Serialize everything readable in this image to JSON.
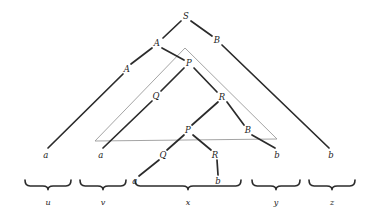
{
  "diagram": {
    "colors": {
      "ink": "#1c1c1c",
      "edge": "#2b2b2b",
      "overlay": "#9a9a9a",
      "background": "#ffffff"
    },
    "nodes": [
      {
        "id": "s-root",
        "label": "S",
        "x": 186,
        "y": 16
      },
      {
        "id": "a-upper",
        "label": "A",
        "x": 157,
        "y": 43
      },
      {
        "id": "b-upper-edge",
        "label": "B",
        "x": 217,
        "y": 40
      },
      {
        "id": "a-left-edge",
        "label": "A",
        "x": 127,
        "y": 69
      },
      {
        "id": "p-upper",
        "label": "P",
        "x": 189,
        "y": 63
      },
      {
        "id": "q-mid",
        "label": "Q",
        "x": 156,
        "y": 96
      },
      {
        "id": "r-mid",
        "label": "R",
        "x": 222,
        "y": 97
      },
      {
        "id": "p-inner",
        "label": "P",
        "x": 188,
        "y": 130
      },
      {
        "id": "b-inner-edge",
        "label": "B",
        "x": 248,
        "y": 130
      },
      {
        "id": "q-lower",
        "label": "Q",
        "x": 163,
        "y": 155
      },
      {
        "id": "r-lower",
        "label": "R",
        "x": 215,
        "y": 155
      }
    ],
    "leaves": [
      {
        "id": "leaf-a-1",
        "label": "a",
        "x": 46,
        "y": 155
      },
      {
        "id": "leaf-a-2",
        "label": "a",
        "x": 101,
        "y": 155
      },
      {
        "id": "leaf-a-3",
        "label": "a",
        "x": 135,
        "y": 181
      },
      {
        "id": "leaf-b-1",
        "label": "b",
        "x": 218,
        "y": 181
      },
      {
        "id": "leaf-b-2",
        "label": "b",
        "x": 277,
        "y": 155
      },
      {
        "id": "leaf-b-3",
        "label": "b",
        "x": 331,
        "y": 155
      }
    ],
    "edges": [
      {
        "id": "edge-s-a",
        "x1": 181,
        "y1": 21,
        "x2": 163,
        "y2": 38
      },
      {
        "id": "edge-s-b",
        "x1": 191,
        "y1": 21,
        "x2": 212,
        "y2": 36
      },
      {
        "id": "edge-a-to-a",
        "x1": 152,
        "y1": 48,
        "x2": 131,
        "y2": 64
      },
      {
        "id": "edge-a-to-p",
        "x1": 162,
        "y1": 48,
        "x2": 184,
        "y2": 60
      },
      {
        "id": "edge-a-leaf",
        "x1": 123,
        "y1": 74,
        "x2": 48,
        "y2": 148
      },
      {
        "id": "edge-b-leaf",
        "x1": 222,
        "y1": 45,
        "x2": 329,
        "y2": 148
      },
      {
        "id": "edge-p-q",
        "x1": 184,
        "y1": 68,
        "x2": 161,
        "y2": 91
      },
      {
        "id": "edge-p-r",
        "x1": 194,
        "y1": 68,
        "x2": 217,
        "y2": 92
      },
      {
        "id": "edge-q-leaf",
        "x1": 152,
        "y1": 101,
        "x2": 103,
        "y2": 148
      },
      {
        "id": "edge-r-p",
        "x1": 218,
        "y1": 102,
        "x2": 192,
        "y2": 125
      },
      {
        "id": "edge-r-b",
        "x1": 227,
        "y1": 102,
        "x2": 244,
        "y2": 125
      },
      {
        "id": "edge-b-leaf-2",
        "x1": 252,
        "y1": 135,
        "x2": 275,
        "y2": 148
      },
      {
        "id": "edge-pi-q",
        "x1": 184,
        "y1": 135,
        "x2": 167,
        "y2": 150
      },
      {
        "id": "edge-pi-r",
        "x1": 193,
        "y1": 135,
        "x2": 211,
        "y2": 150
      },
      {
        "id": "edge-q-a",
        "x1": 159,
        "y1": 160,
        "x2": 139,
        "y2": 176
      },
      {
        "id": "edge-r-b-vert",
        "x1": 217,
        "y1": 160,
        "x2": 218,
        "y2": 175
      }
    ],
    "overlay_triangle": {
      "id": "gray-triangle",
      "apex_x": 185,
      "apex_y": 48,
      "left_x": 95,
      "left_y": 141,
      "right_x": 277,
      "right_y": 139
    },
    "braces": [
      {
        "id": "brace-u",
        "label": "u",
        "x1": 25,
        "x2": 71,
        "y": 186,
        "label_x": 48,
        "label_y": 203
      },
      {
        "id": "brace-v",
        "label": "v",
        "x1": 80,
        "x2": 126,
        "y": 186,
        "label_x": 103,
        "label_y": 203
      },
      {
        "id": "brace-x",
        "label": "x",
        "x1": 135,
        "x2": 241,
        "y": 186,
        "label_x": 188,
        "label_y": 203
      },
      {
        "id": "brace-y",
        "label": "y",
        "x1": 252,
        "x2": 300,
        "y": 186,
        "label_x": 276,
        "label_y": 203
      },
      {
        "id": "brace-z",
        "label": "z",
        "x1": 309,
        "x2": 355,
        "y": 186,
        "label_x": 332,
        "label_y": 203
      }
    ]
  }
}
